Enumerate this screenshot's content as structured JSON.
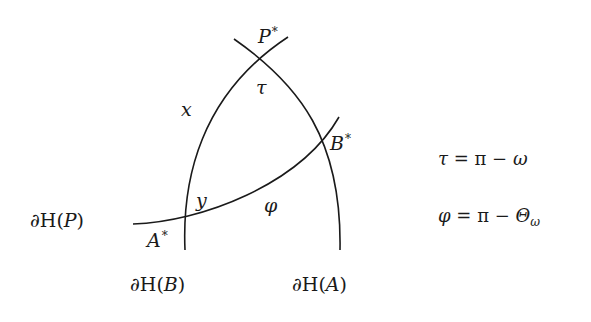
{
  "diagram": {
    "curves": [
      {
        "id": "dH_B",
        "label": "∂H(B)",
        "path": "M 185 250 C 182 180, 200 95, 288 37"
      },
      {
        "id": "dH_A",
        "label": "∂H(A)",
        "path": "M 234 39 C 300 85, 342 140, 340 250"
      },
      {
        "id": "dH_P",
        "label": "∂H(P)",
        "path": "M 133 224 C 200 222, 300 185, 339 117"
      }
    ],
    "stroke_color": "#1a1a1a",
    "points": {
      "P_star": {
        "name": "P",
        "sup": "*"
      },
      "A_star": {
        "name": "A",
        "sup": "*"
      },
      "B_star": {
        "name": "B",
        "sup": "*"
      }
    },
    "angle_labels": {
      "tau": "τ",
      "phi": "φ",
      "x": "x",
      "y": "y"
    },
    "boundary_labels": {
      "P": {
        "prefix": "∂H(",
        "var": "P",
        "suffix": ")"
      },
      "B": {
        "prefix": "∂H(",
        "var": "B",
        "suffix": ")"
      },
      "A": {
        "prefix": "∂H(",
        "var": "A",
        "suffix": ")"
      }
    },
    "equations": [
      {
        "lhs": "τ",
        "eq": " = ",
        "rhs_const": "π",
        "op": " − ",
        "rhs_var": "ω",
        "rhs_sub": ""
      },
      {
        "lhs": "φ",
        "eq": " = ",
        "rhs_const": "π",
        "op": " − ",
        "rhs_var": "Θ",
        "rhs_sub": "ω"
      }
    ]
  }
}
